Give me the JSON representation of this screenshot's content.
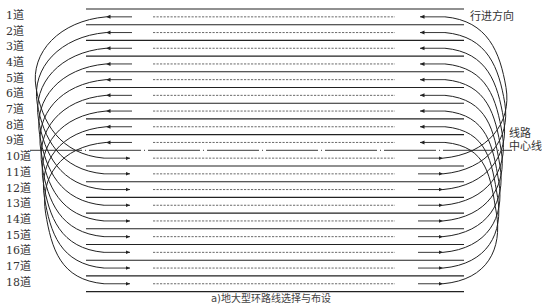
{
  "diagram": {
    "title_caption": "a)地大型环路线选择与布设",
    "direction_label": "行进方向",
    "centerline_label_line1": "线路",
    "centerline_label_line2": "中心线",
    "lanes": [
      {
        "label": "1道",
        "direction": "left"
      },
      {
        "label": "2道",
        "direction": "left"
      },
      {
        "label": "3道",
        "direction": "left"
      },
      {
        "label": "4道",
        "direction": "left"
      },
      {
        "label": "5道",
        "direction": "left"
      },
      {
        "label": "6道",
        "direction": "left"
      },
      {
        "label": "7道",
        "direction": "left"
      },
      {
        "label": "8道",
        "direction": "left"
      },
      {
        "label": "9道",
        "direction": "left"
      },
      {
        "label": "10道",
        "direction": "right"
      },
      {
        "label": "11道",
        "direction": "right"
      },
      {
        "label": "12道",
        "direction": "right"
      },
      {
        "label": "13道",
        "direction": "right"
      },
      {
        "label": "14道",
        "direction": "right"
      },
      {
        "label": "15道",
        "direction": "right"
      },
      {
        "label": "16道",
        "direction": "right"
      },
      {
        "label": "17道",
        "direction": "right"
      },
      {
        "label": "18道",
        "direction": "right"
      }
    ],
    "colors": {
      "line": "#222222",
      "dash": "#444444",
      "text": "#333333"
    }
  }
}
